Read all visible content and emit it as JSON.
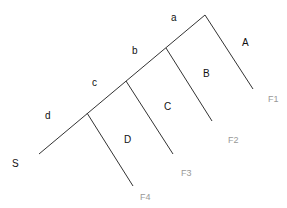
{
  "diagram": {
    "segment_labels": {
      "a": "a",
      "b": "b",
      "c": "c",
      "d": "d"
    },
    "start_label": "S",
    "branch_labels": {
      "A": "A",
      "B": "B",
      "C": "C",
      "D": "D"
    },
    "end_labels": {
      "F1": "F1",
      "F2": "F2",
      "F3": "F3",
      "F4": "F4"
    },
    "colors": {
      "line": "#333333",
      "label": "#111111",
      "end_label": "#999999"
    }
  }
}
